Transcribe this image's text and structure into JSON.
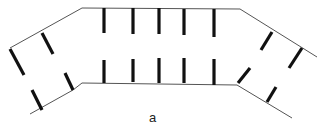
{
  "figure": {
    "label": "a",
    "colors": {
      "line": "#555555",
      "bar": "#111111",
      "background": "#ffffff"
    },
    "upper_line": [
      [
        10,
        48
      ],
      [
        82,
        8
      ],
      [
        240,
        9
      ],
      [
        317,
        57
      ]
    ],
    "lower_line": [
      [
        30,
        114
      ],
      [
        73,
        90
      ],
      [
        82,
        83
      ],
      [
        237,
        85
      ],
      [
        292,
        118
      ]
    ],
    "upper_bars": [
      [
        10,
        49,
        24,
        75
      ],
      [
        42,
        33,
        53,
        54
      ],
      [
        104,
        8,
        104,
        33
      ],
      [
        133,
        8,
        133,
        34
      ],
      [
        159,
        8,
        159,
        34
      ],
      [
        184,
        9,
        184,
        35
      ],
      [
        214,
        9,
        214,
        37
      ],
      [
        272,
        32,
        261,
        50
      ],
      [
        302,
        48,
        289,
        68
      ]
    ],
    "lower_bars": [
      [
        32,
        90,
        42,
        110
      ],
      [
        65,
        73,
        73,
        90
      ],
      [
        104,
        60,
        104,
        83
      ],
      [
        133,
        59,
        133,
        82
      ],
      [
        159,
        58,
        159,
        83
      ],
      [
        184,
        58,
        184,
        83
      ],
      [
        214,
        59,
        214,
        85
      ],
      [
        250,
        68,
        238,
        83
      ],
      [
        276,
        87,
        267,
        102
      ]
    ]
  }
}
